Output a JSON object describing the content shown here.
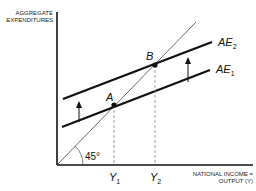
{
  "diagram": {
    "type": "keynesian-cross",
    "y_axis_label_line1": "AGGREGATE",
    "y_axis_label_line2": "EXPENDITURES",
    "x_axis_label_line1": "NATIONAL INCOME =",
    "x_axis_label_line2": "OUTPUT (Y)",
    "angle_label": "45°",
    "curves": [
      {
        "name": "AE",
        "subscript": "1"
      },
      {
        "name": "AE",
        "subscript": "2"
      }
    ],
    "points": [
      {
        "label": "A"
      },
      {
        "label": "B"
      }
    ],
    "x_ticks": [
      {
        "name": "Y",
        "subscript": "1"
      },
      {
        "name": "Y",
        "subscript": "2"
      }
    ],
    "colors": {
      "line": "#111111",
      "guide": "#555555",
      "dashed": "#888888"
    }
  }
}
